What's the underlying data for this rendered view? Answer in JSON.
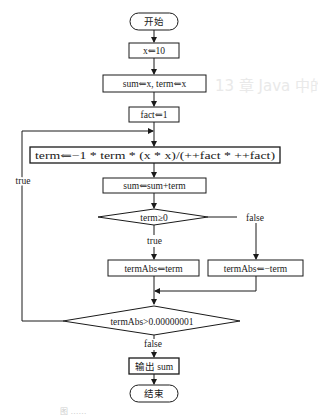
{
  "flowchart": {
    "start": "开始",
    "end": "结束",
    "steps": {
      "init_x": "x⇐10",
      "init_sum_term": "sum⇐x, term⇐x",
      "init_fact": "fact⇐1",
      "update_term": "term⇐−1 * term * (x * x)/(++fact * ++fact)",
      "update_sum": "sum⇐sum+term",
      "abs_pos": "termAbs⇐term",
      "abs_neg": "termAbs⇐−term",
      "output": "输出 sum"
    },
    "decisions": {
      "sign_check": "term≥0",
      "loop_check": "termAbs>0.00000001"
    },
    "edge_labels": {
      "sign_true": "true",
      "sign_false": "false",
      "loop_true": "true",
      "loop_false": "false"
    }
  },
  "background": {
    "heading_ghost": "13 章  Java 中的循环结构",
    "caption_ghost": "图 ……"
  }
}
